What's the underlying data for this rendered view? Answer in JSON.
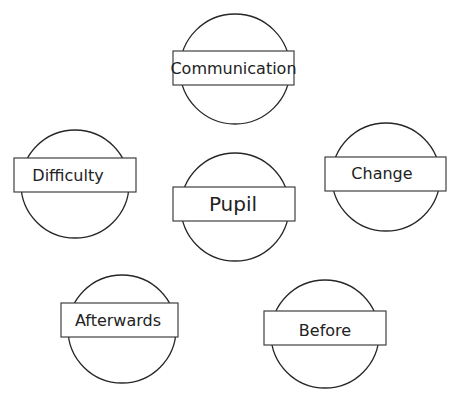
{
  "diagram": {
    "title": "",
    "nodes": [
      {
        "id": "communication",
        "label": "Communication",
        "cx": 235,
        "cy": 69,
        "r": 55,
        "rect": {
          "x": 173,
          "y": 51,
          "w": 121,
          "h": 34
        },
        "font_size": 16
      },
      {
        "id": "difficulty",
        "label": "Difficulty",
        "cx": 75,
        "cy": 184,
        "r": 54,
        "rect": {
          "x": 14,
          "y": 158,
          "w": 122,
          "h": 34
        },
        "font_size": 16
      },
      {
        "id": "pupil",
        "label": "Pupil",
        "cx": 235,
        "cy": 207,
        "r": 54,
        "rect": {
          "x": 173,
          "y": 187,
          "w": 122,
          "h": 34
        },
        "font_size": 20
      },
      {
        "id": "change",
        "label": "Change",
        "cx": 386,
        "cy": 177,
        "r": 54,
        "rect": {
          "x": 325,
          "y": 157,
          "w": 121,
          "h": 34
        },
        "font_size": 16
      },
      {
        "id": "afterwards",
        "label": "Afterwards",
        "cx": 122,
        "cy": 329,
        "r": 54,
        "rect": {
          "x": 61,
          "y": 303,
          "w": 117,
          "h": 34
        },
        "font_size": 16
      },
      {
        "id": "before",
        "label": "Before",
        "cx": 325,
        "cy": 334,
        "r": 54,
        "rect": {
          "x": 264,
          "y": 311,
          "w": 122,
          "h": 34
        },
        "font_size": 16
      }
    ],
    "stroke_color": "#262626",
    "fill_color": "#ffffff"
  }
}
